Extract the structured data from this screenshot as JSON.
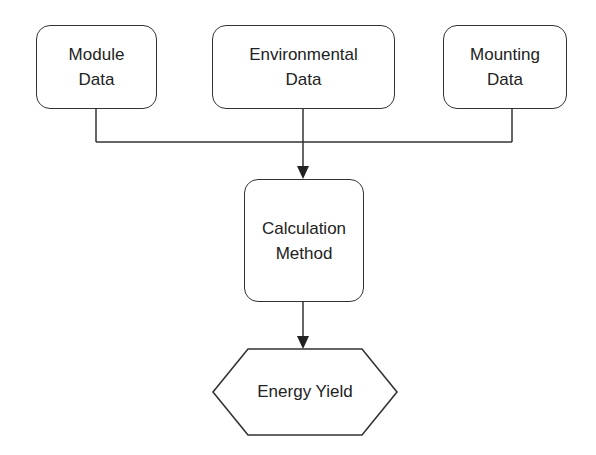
{
  "diagram": {
    "type": "flowchart",
    "inputs": [
      {
        "id": "module",
        "line1": "Module",
        "line2": "Data"
      },
      {
        "id": "environmental",
        "line1": "Environmental",
        "line2": "Data"
      },
      {
        "id": "mounting",
        "line1": "Mounting",
        "line2": "Data"
      }
    ],
    "process": {
      "line1": "Calculation",
      "line2": "Method"
    },
    "output": {
      "label": "Energy Yield",
      "shape": "hexagon"
    },
    "edges": [
      {
        "from": "Module Data",
        "to": "Calculation Method"
      },
      {
        "from": "Environmental Data",
        "to": "Calculation Method"
      },
      {
        "from": "Mounting Data",
        "to": "Calculation Method"
      },
      {
        "from": "Calculation Method",
        "to": "Energy Yield"
      }
    ],
    "colors": {
      "stroke": "#333333",
      "background": "#ffffff",
      "text": "#222222"
    }
  }
}
